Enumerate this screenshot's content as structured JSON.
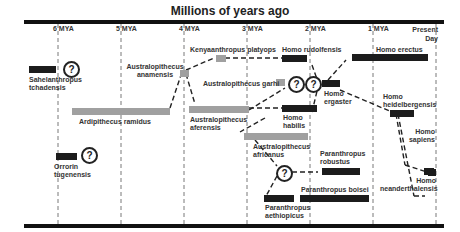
{
  "title": "Millions of years ago",
  "ticks": [
    "6 MYA",
    "5 MYA",
    "4 MYA",
    "3 MYA",
    "2 MYA",
    "1 MYA",
    "Present Day"
  ],
  "species": {
    "sahelanthropus": "Sahelanthropus tchadensis",
    "orrorin": "Orrorin tugenensis",
    "ardipithecus": "Ardipithecus ramidus",
    "anamensis": "Australopithecus anamensis",
    "kenyanthropus": "Kenyaanthropus platyops",
    "afarensis": "Australopithecus aferensis",
    "garhi": "Australopithecus garhi",
    "africanus": "Australopithecus africanus",
    "rudolfensis": "Homo rudolfensis",
    "habilis": "Homo habilis",
    "ergaster": "Homo ergaster",
    "erectus": "Homo erectus",
    "heidelbergensis": "Homo heidelbergensis",
    "sapiens": "Homo sapiens",
    "neanderthalensis": "Homo neanderthalensis",
    "robustus": "Paranthropus robustus",
    "boisei": "Paranthropus boisei",
    "aethiopicus": "Paranthropus aethiopicus"
  },
  "uncertain_marker": "?",
  "colors": {
    "homo": "#1c1c1c",
    "australopith": "#a0a0a0",
    "axis": "#111111"
  }
}
